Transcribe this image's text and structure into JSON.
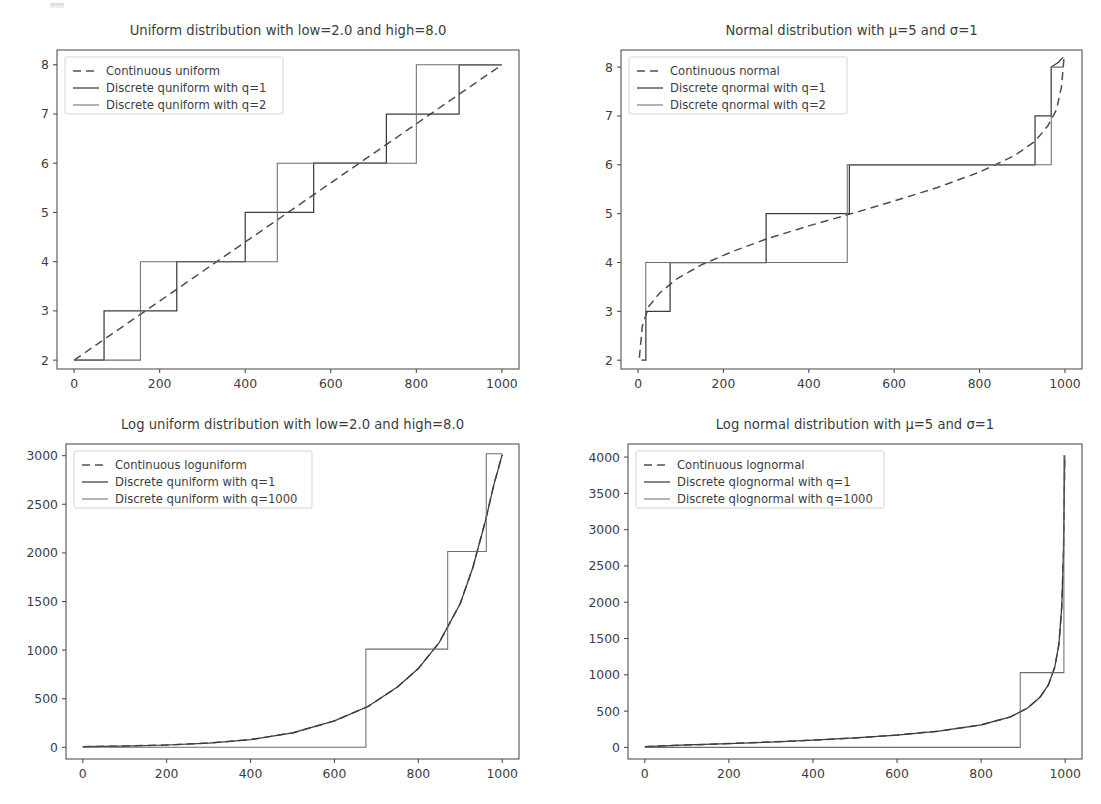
{
  "figure": {
    "width": 1101,
    "height": 804,
    "background": "#ffffff",
    "artifact_note": "scanned-page-speck"
  },
  "colors": {
    "continuous": "#4e4e4e",
    "discrete_q1": "#3c3c3c",
    "discrete_q2": "#6d6d6d",
    "axis": "#4a4a4a",
    "text": "#3d3d3d",
    "legend_border": "#cfcfcf"
  },
  "chart_data": [
    {
      "id": "uniform",
      "type": "line",
      "title": "Uniform distribution with low=2.0 and high=8.0",
      "xlabel": "",
      "ylabel": "",
      "xlim": [
        -40,
        1040
      ],
      "ylim": [
        1.82,
        8.3
      ],
      "grid": false,
      "legend_position": "upper left",
      "xticks": [
        0,
        200,
        400,
        600,
        800,
        1000
      ],
      "yticks": [
        2,
        3,
        4,
        5,
        6,
        7,
        8
      ],
      "series": [
        {
          "name": "Continuous uniform",
          "style": "dashed",
          "color": "#4e4e4e",
          "x": [
            0,
            100,
            200,
            300,
            400,
            500,
            600,
            700,
            800,
            900,
            1000
          ],
          "y": [
            2.0,
            2.6,
            3.2,
            3.8,
            4.4,
            5.0,
            5.6,
            6.2,
            6.8,
            7.4,
            8.0
          ]
        },
        {
          "name": "Discrete quniform with q=1",
          "style": "step",
          "color": "#3c3c3c",
          "x": [
            0,
            70,
            70,
            240,
            240,
            400,
            400,
            560,
            560,
            730,
            730,
            900,
            900,
            1000
          ],
          "y": [
            2,
            2,
            3,
            3,
            4,
            4,
            5,
            5,
            6,
            6,
            7,
            7,
            8,
            8
          ]
        },
        {
          "name": "Discrete quniform with q=2",
          "style": "step",
          "color": "#6d6d6d",
          "x": [
            0,
            155,
            155,
            475,
            475,
            800,
            800,
            1000
          ],
          "y": [
            2,
            2,
            4,
            4,
            6,
            6,
            8,
            8
          ]
        }
      ]
    },
    {
      "id": "normal",
      "type": "line",
      "title": "Normal distribution with μ=5 and σ=1",
      "xlabel": "",
      "ylabel": "",
      "xlim": [
        -40,
        1040
      ],
      "ylim": [
        1.82,
        8.35
      ],
      "grid": false,
      "legend_position": "upper left",
      "xticks": [
        0,
        200,
        400,
        600,
        800,
        1000
      ],
      "yticks": [
        2,
        3,
        4,
        5,
        6,
        7,
        8
      ],
      "series": [
        {
          "name": "Continuous normal",
          "style": "dashed",
          "color": "#4e4e4e",
          "x": [
            3,
            10,
            25,
            50,
            90,
            150,
            220,
            300,
            400,
            500,
            600,
            700,
            800,
            880,
            930,
            960,
            980,
            992,
            998
          ],
          "y": [
            2.05,
            2.7,
            3.1,
            3.37,
            3.66,
            3.96,
            4.22,
            4.48,
            4.75,
            5.0,
            5.26,
            5.53,
            5.85,
            6.18,
            6.48,
            6.8,
            7.12,
            7.6,
            8.2
          ]
        },
        {
          "name": "Discrete qnormal with q=1",
          "style": "step",
          "color": "#3c3c3c",
          "x": [
            8,
            8,
            18,
            18,
            75,
            75,
            300,
            300,
            495,
            495,
            695,
            695,
            930,
            930,
            968,
            968,
            985,
            990,
            996
          ],
          "y": [
            2,
            2,
            2,
            3,
            3,
            4,
            4,
            5,
            5,
            6,
            6,
            6,
            6,
            7,
            7,
            8,
            8.1,
            8.15,
            8.2
          ]
        },
        {
          "name": "Discrete qnormal with q=2",
          "style": "step",
          "color": "#6d6d6d",
          "x": [
            8,
            18,
            18,
            70,
            70,
            490,
            490,
            695,
            695,
            968,
            968,
            996
          ],
          "y": [
            2,
            2,
            4,
            4,
            4,
            4,
            6,
            6,
            6,
            6,
            8,
            8
          ]
        }
      ]
    },
    {
      "id": "loguniform",
      "type": "line",
      "title": "Log uniform distribution with low=2.0 and high=8.0",
      "xlabel": "",
      "ylabel": "",
      "xlim": [
        -40,
        1040
      ],
      "ylim": [
        -120,
        3120
      ],
      "grid": false,
      "legend_position": "upper left",
      "xticks": [
        0,
        200,
        400,
        600,
        800,
        1000
      ],
      "yticks": [
        0,
        500,
        1000,
        1500,
        2000,
        2500,
        3000
      ],
      "series": [
        {
          "name": "Continuous loguniform",
          "style": "dashed",
          "color": "#4e4e4e",
          "x": [
            0,
            100,
            200,
            300,
            400,
            500,
            600,
            680,
            750,
            800,
            850,
            900,
            930,
            960,
            980,
            1000
          ],
          "y": [
            7,
            13,
            24,
            44,
            80,
            148,
            272,
            420,
            620,
            810,
            1080,
            1480,
            1850,
            2330,
            2700,
            3010
          ]
        },
        {
          "name": "Discrete quniform with q=1",
          "style": "step",
          "color": "#3c3c3c",
          "x": [
            0,
            100,
            200,
            300,
            400,
            500,
            600,
            680,
            750,
            800,
            850,
            900,
            930,
            960,
            980,
            1000
          ],
          "y": [
            7,
            13,
            24,
            44,
            80,
            148,
            272,
            420,
            620,
            810,
            1080,
            1480,
            1850,
            2330,
            2700,
            3010
          ]
        },
        {
          "name": "Discrete quniform with q=1000",
          "style": "step",
          "color": "#6d6d6d",
          "x": [
            0,
            675,
            675,
            870,
            870,
            962,
            962,
            1000
          ],
          "y": [
            0,
            0,
            1010,
            1010,
            2015,
            2015,
            3020,
            3020
          ]
        }
      ]
    },
    {
      "id": "lognormal",
      "type": "line",
      "title": "Log normal distribution with μ=5 and σ=1",
      "xlabel": "",
      "ylabel": "",
      "xlim": [
        -40,
        1040
      ],
      "ylim": [
        -160,
        4180
      ],
      "grid": false,
      "legend_position": "upper left",
      "xticks": [
        0,
        200,
        400,
        600,
        800,
        1000
      ],
      "yticks": [
        0,
        500,
        1000,
        1500,
        2000,
        2500,
        3000,
        3500,
        4000
      ],
      "series": [
        {
          "name": "Continuous lognormal",
          "style": "dashed",
          "color": "#4e4e4e",
          "x": [
            0,
            50,
            100,
            200,
            300,
            400,
            500,
            600,
            700,
            800,
            870,
            910,
            940,
            960,
            975,
            985,
            992,
            996,
            999
          ],
          "y": [
            10,
            22,
            33,
            52,
            74,
            100,
            130,
            170,
            225,
            310,
            420,
            540,
            690,
            860,
            1100,
            1420,
            1950,
            2700,
            4020
          ]
        },
        {
          "name": "Discrete qlognormal with q=1",
          "style": "step",
          "color": "#3c3c3c",
          "x": [
            0,
            50,
            100,
            200,
            300,
            400,
            500,
            600,
            700,
            800,
            870,
            910,
            940,
            960,
            975,
            985,
            992,
            996,
            999
          ],
          "y": [
            10,
            22,
            33,
            52,
            74,
            100,
            130,
            170,
            225,
            310,
            420,
            540,
            690,
            860,
            1100,
            1420,
            1950,
            2700,
            4020
          ]
        },
        {
          "name": "Discrete qlognormal with q=1000",
          "style": "step",
          "color": "#6d6d6d",
          "x": [
            0,
            893,
            893,
            997,
            997,
            999
          ],
          "y": [
            0,
            0,
            1030,
            1030,
            4020,
            4020
          ]
        }
      ]
    }
  ]
}
